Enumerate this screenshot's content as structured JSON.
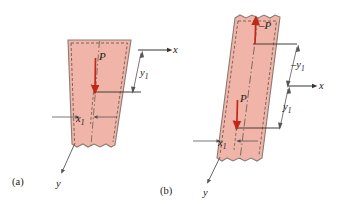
{
  "figure": {
    "type": "mechanics-diagram",
    "colors": {
      "strip_fill": "#f0b5a8",
      "strip_edge": "#8d7a72",
      "force_arrow": "#c0281a",
      "axis_line": "#3a3a3a",
      "dimension_line": "#555555",
      "background": "#ffffff"
    }
  },
  "panels": [
    {
      "id": "a",
      "caption": "(a)",
      "axes": {
        "x_label": "x",
        "y_label": "y"
      },
      "forces": [
        {
          "name": "P",
          "label": "P",
          "direction": "down"
        }
      ],
      "dimensions": [
        {
          "name": "y1",
          "label": "y",
          "subscript": "1"
        },
        {
          "name": "x1",
          "label": "x",
          "subscript": "1"
        }
      ]
    },
    {
      "id": "b",
      "caption": "(b)",
      "axes": {
        "x_label": "x",
        "y_label": "y"
      },
      "forces": [
        {
          "name": "minus-P",
          "label": "–P",
          "direction": "up"
        },
        {
          "name": "P",
          "label": "P",
          "direction": "down"
        }
      ],
      "dimensions": [
        {
          "name": "minus-y1",
          "label": "–y",
          "subscript": "1"
        },
        {
          "name": "y1",
          "label": "y",
          "subscript": "1"
        },
        {
          "name": "x1",
          "label": "x",
          "subscript": "1"
        }
      ]
    }
  ]
}
